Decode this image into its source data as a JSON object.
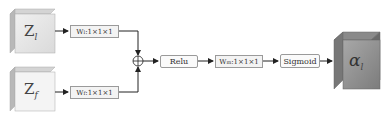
{
  "diagram": {
    "inputs": [
      {
        "symbol": "Z",
        "subscript": "l",
        "weight_label": "W",
        "weight_sub": "l",
        "weight_dims": ":1×1×1"
      },
      {
        "symbol": "Z",
        "subscript": "f",
        "weight_label": "W",
        "weight_sub": "f",
        "weight_dims": ":1×1×1"
      }
    ],
    "sum_node": "⊕",
    "relu_label": "Relu",
    "merge_weight": {
      "label": "W",
      "sub": "m",
      "dims": ":1×1×1"
    },
    "sigmoid_label": "Sigmoid",
    "output": {
      "symbol": "α",
      "subscript": "l"
    },
    "colors": {
      "input_cube_front": "#e6e6e6",
      "input_cube_side": "#bdbdbd",
      "output_cube_front": "#8f8f8f",
      "output_cube_side": "#5e5e5e",
      "box_border": "#9a9a9a",
      "arrow": "#222222"
    }
  }
}
